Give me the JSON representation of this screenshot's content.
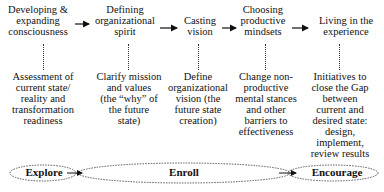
{
  "stages": [
    {
      "lines": [
        "Developing &",
        "expanding",
        "consciousness"
      ]
    },
    {
      "lines": [
        "Defining",
        "organizational",
        "spirit"
      ]
    },
    {
      "lines": [
        "Casting",
        "vision"
      ]
    },
    {
      "lines": [
        "Choosing",
        "productive",
        "mindsets"
      ]
    },
    {
      "lines": [
        "Living in the",
        "experience"
      ]
    }
  ],
  "descriptions": [
    {
      "lines": [
        "Assessment of",
        "current state/",
        "reality and",
        "transformation",
        "readiness"
      ]
    },
    {
      "lines": [
        "Clarify mission",
        "and values",
        "(the “why” of",
        "the future",
        "state)"
      ]
    },
    {
      "lines": [
        "Define",
        "organizational",
        "vision (the",
        "future state",
        "creation)"
      ]
    },
    {
      "lines": [
        "Change non-",
        "productive",
        "mental stances",
        "and other",
        "barriers to",
        "effectiveness"
      ]
    },
    {
      "lines": [
        "Initiatives to",
        "close the Gap",
        "between",
        "current and",
        "desired state:",
        "design,",
        "implement,",
        "review results"
      ]
    }
  ],
  "phases": [
    {
      "label": "Explore"
    },
    {
      "label": "Enroll"
    },
    {
      "label": "Encourage"
    }
  ]
}
